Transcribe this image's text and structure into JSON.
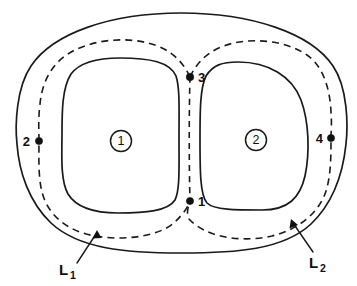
{
  "figure": {
    "background_color": "#ffffff",
    "stroke_color": "#1a1a1a",
    "width": 357,
    "height": 286
  },
  "regions": [
    {
      "id": "region-1",
      "label": "1",
      "cx": 121,
      "cy": 141
    },
    {
      "id": "region-2",
      "label": "2",
      "cx": 256,
      "cy": 140
    }
  ],
  "nodes": [
    {
      "id": "node-1",
      "label": "1",
      "x": 190,
      "y": 201,
      "label_x": 198,
      "label_y": 206
    },
    {
      "id": "node-2",
      "label": "2",
      "x": 39,
      "y": 141,
      "label_x": 23,
      "label_y": 146
    },
    {
      "id": "node-3",
      "label": "3",
      "x": 190,
      "y": 77,
      "label_x": 198,
      "label_y": 82
    },
    {
      "id": "node-4",
      "label": "4",
      "x": 331,
      "y": 138,
      "label_x": 316,
      "label_y": 143
    }
  ],
  "contours": [
    {
      "id": "contour-L1",
      "label": "L",
      "subscript": "1",
      "label_x": 62,
      "label_y": 272,
      "sub_x": 73,
      "sub_y": 276,
      "leader_from_x": 77,
      "leader_from_y": 263,
      "leader_to_x": 97,
      "leader_to_y": 232
    },
    {
      "id": "contour-L2",
      "label": "L",
      "subscript": "2",
      "label_x": 311,
      "label_y": 265,
      "sub_x": 322,
      "sub_y": 269,
      "leader_from_x": 310,
      "leader_from_y": 255,
      "leader_to_x": 291,
      "leader_to_y": 222
    }
  ],
  "shapes": {
    "outer_boundary": "solid-ellipse",
    "inner_lobe_left": "solid-rounded-blob",
    "inner_lobe_right": "solid-rounded-blob",
    "contour_style": "dashed"
  }
}
